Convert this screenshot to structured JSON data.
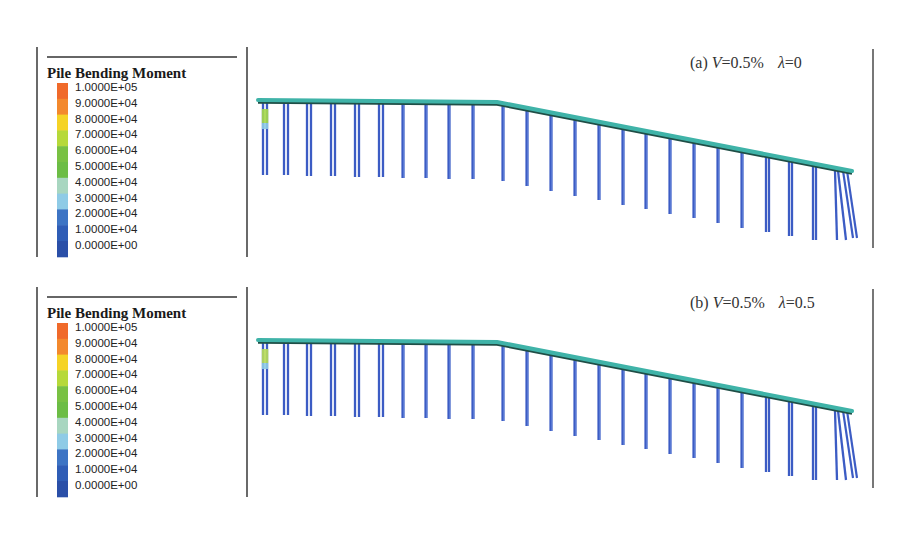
{
  "figure": {
    "panels": [
      {
        "id": "a",
        "label_prefix": "(a) ",
        "label_var1": "V",
        "label_val1": "=0.5%",
        "label_var2": "λ",
        "label_val2": "=0",
        "offset_y": 0,
        "hotspot_color": "#a6d94a"
      },
      {
        "id": "b",
        "label_prefix": "(b) ",
        "label_var1": "V",
        "label_val1": "=0.5%",
        "label_var2": "λ",
        "label_val2": "=0.5",
        "offset_y": 240,
        "hotspot_color": "#b8dc58"
      }
    ],
    "legend": {
      "title": "Pile Bending Moment",
      "labels": [
        "1.0000E+05",
        "9.0000E+04",
        "8.0000E+04",
        "7.0000E+04",
        "6.0000E+04",
        "5.0000E+04",
        "4.0000E+04",
        "3.0000E+04",
        "2.0000E+04",
        "1.0000E+04",
        "0.0000E+00"
      ],
      "colors": [
        "#f06a2a",
        "#f3892d",
        "#f5d326",
        "#b6d93a",
        "#79c143",
        "#6cbd45",
        "#a8d6c0",
        "#8fcbe6",
        "#3d74c4",
        "#2f5db6",
        "#2a4fa8"
      ]
    },
    "colors": {
      "deck": "#3fb3a8",
      "deck_shadow": "#1f4e46",
      "pile": "#3c5cc4",
      "pile_light": "#6f8fe0",
      "frame": "#444444"
    },
    "deck": {
      "start": [
        258,
        100
      ],
      "knee": [
        497,
        102
      ],
      "end": [
        852,
        171
      ]
    },
    "piles": [
      {
        "x": 263,
        "bottom": 175,
        "pair": 4
      },
      {
        "x": 284,
        "bottom": 175,
        "pair": 4
      },
      {
        "x": 307,
        "bottom": 176,
        "pair": 4
      },
      {
        "x": 331,
        "bottom": 176,
        "pair": 4
      },
      {
        "x": 355,
        "bottom": 177,
        "pair": 4
      },
      {
        "x": 379,
        "bottom": 177,
        "pair": 4
      },
      {
        "x": 403,
        "bottom": 178,
        "pair": 0
      },
      {
        "x": 426,
        "bottom": 178,
        "pair": 0
      },
      {
        "x": 449,
        "bottom": 179,
        "pair": 0
      },
      {
        "x": 473,
        "bottom": 179,
        "pair": 0
      },
      {
        "x": 503,
        "bottom": 181,
        "pair": 0
      },
      {
        "x": 527,
        "bottom": 186,
        "pair": 0
      },
      {
        "x": 551,
        "bottom": 191,
        "pair": 0
      },
      {
        "x": 575,
        "bottom": 196,
        "pair": 0
      },
      {
        "x": 599,
        "bottom": 200,
        "pair": 0
      },
      {
        "x": 623,
        "bottom": 205,
        "pair": 0
      },
      {
        "x": 646,
        "bottom": 209,
        "pair": 0
      },
      {
        "x": 670,
        "bottom": 214,
        "pair": 0
      },
      {
        "x": 694,
        "bottom": 218,
        "pair": 0
      },
      {
        "x": 718,
        "bottom": 223,
        "pair": 0
      },
      {
        "x": 742,
        "bottom": 228,
        "pair": 0
      },
      {
        "x": 766,
        "bottom": 232,
        "pair": 3
      },
      {
        "x": 789,
        "bottom": 236,
        "pair": 3
      },
      {
        "x": 813,
        "bottom": 240,
        "pair": 3
      },
      {
        "x": 835,
        "bottom": 240,
        "pair": 3,
        "battered": true
      }
    ]
  }
}
